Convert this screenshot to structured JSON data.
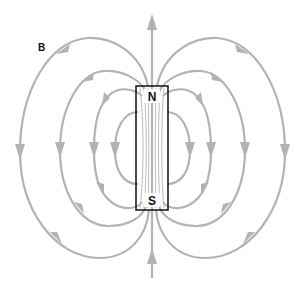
{
  "diagram": {
    "field_label": "B",
    "magnet": {
      "north_label": "N",
      "south_label": "S"
    },
    "colors": {
      "field_lines": "#b3b3b3",
      "magnet_outline": "#111111",
      "labels": "#111111",
      "background": "#ffffff"
    },
    "loops_per_side": 4,
    "field_direction": "out of N pole, around, into S pole"
  }
}
